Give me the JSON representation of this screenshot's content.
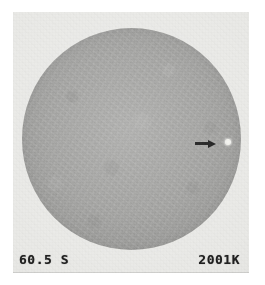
{
  "image": {
    "type": "solar-disk-photograph",
    "description": "Grainy grayscale full-disk solar image with an arrow marking a bright point",
    "background_color": "#ffffff",
    "plate_color": "#e9e9e6",
    "disk_color": "#9a9a98"
  },
  "annotation": {
    "arrow": {
      "icon": "arrow-right-icon",
      "color": "#141414",
      "direction": "right"
    },
    "marker": {
      "icon": "bright-point-icon",
      "color": "#f2f2ee",
      "label": "bright point"
    }
  },
  "labels": {
    "left": "60.5 S",
    "right": "2001K"
  }
}
